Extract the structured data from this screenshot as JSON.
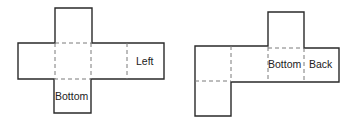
{
  "diagram": {
    "type": "cube-nets",
    "nets": [
      {
        "id": "net-1",
        "shape": "cross",
        "labels": [
          {
            "text": "Left",
            "face": "right end of horizontal band"
          },
          {
            "text": "Bottom",
            "face": "square below center"
          }
        ]
      },
      {
        "id": "net-2",
        "shape": "offset",
        "labels": [
          {
            "text": "Bottom",
            "face": "third square of band, under top square"
          },
          {
            "text": "Back",
            "face": "rightmost square of band"
          }
        ]
      }
    ],
    "colors": {
      "line": "#2a2a2a",
      "fold_line": "#7a7a7a",
      "background": "#ffffff"
    }
  }
}
